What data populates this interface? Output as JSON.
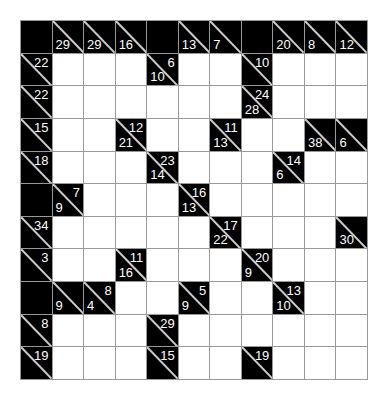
{
  "puzzle": {
    "type": "kakuro",
    "rows": 11,
    "cols": 11,
    "colors": {
      "block": "#000000",
      "cell": "#ffffff",
      "grid_line": "#999999",
      "clue_text": "#ffffff"
    },
    "grid": [
      [
        {
          "t": "b"
        },
        {
          "t": "c",
          "d": "29"
        },
        {
          "t": "c",
          "d": "29"
        },
        {
          "t": "c",
          "d": "16"
        },
        {
          "t": "b"
        },
        {
          "t": "c",
          "d": "13"
        },
        {
          "t": "c",
          "d": "7"
        },
        {
          "t": "b"
        },
        {
          "t": "c",
          "d": "20"
        },
        {
          "t": "c",
          "d": "8"
        },
        {
          "t": "c",
          "d": "12"
        }
      ],
      [
        {
          "t": "c",
          "a": "22"
        },
        {
          "t": "w"
        },
        {
          "t": "w"
        },
        {
          "t": "w"
        },
        {
          "t": "c",
          "a": "6",
          "d": "10"
        },
        {
          "t": "w"
        },
        {
          "t": "w"
        },
        {
          "t": "c",
          "a": "10"
        },
        {
          "t": "w"
        },
        {
          "t": "w"
        },
        {
          "t": "w"
        }
      ],
      [
        {
          "t": "c",
          "a": "22"
        },
        {
          "t": "w"
        },
        {
          "t": "w"
        },
        {
          "t": "w"
        },
        {
          "t": "w"
        },
        {
          "t": "w"
        },
        {
          "t": "w"
        },
        {
          "t": "c",
          "a": "24",
          "d": "28"
        },
        {
          "t": "w"
        },
        {
          "t": "w"
        },
        {
          "t": "w"
        }
      ],
      [
        {
          "t": "c",
          "a": "15"
        },
        {
          "t": "w"
        },
        {
          "t": "w"
        },
        {
          "t": "c",
          "a": "12",
          "d": "21"
        },
        {
          "t": "w"
        },
        {
          "t": "w"
        },
        {
          "t": "c",
          "a": "11",
          "d": "13"
        },
        {
          "t": "w"
        },
        {
          "t": "w"
        },
        {
          "t": "c",
          "d": "38"
        },
        {
          "t": "c",
          "d": "6"
        }
      ],
      [
        {
          "t": "c",
          "a": "18"
        },
        {
          "t": "w"
        },
        {
          "t": "w"
        },
        {
          "t": "w"
        },
        {
          "t": "c",
          "a": "23",
          "d": "14"
        },
        {
          "t": "w"
        },
        {
          "t": "w"
        },
        {
          "t": "w"
        },
        {
          "t": "c",
          "a": "14",
          "d": "6"
        },
        {
          "t": "w"
        },
        {
          "t": "w"
        }
      ],
      [
        {
          "t": "b"
        },
        {
          "t": "c",
          "a": "7",
          "d": "9"
        },
        {
          "t": "w"
        },
        {
          "t": "w"
        },
        {
          "t": "w"
        },
        {
          "t": "c",
          "a": "16",
          "d": "13"
        },
        {
          "t": "w"
        },
        {
          "t": "w"
        },
        {
          "t": "w"
        },
        {
          "t": "w"
        },
        {
          "t": "w"
        }
      ],
      [
        {
          "t": "c",
          "a": "34"
        },
        {
          "t": "w"
        },
        {
          "t": "w"
        },
        {
          "t": "w"
        },
        {
          "t": "w"
        },
        {
          "t": "w"
        },
        {
          "t": "c",
          "a": "17",
          "d": "22"
        },
        {
          "t": "w"
        },
        {
          "t": "w"
        },
        {
          "t": "w"
        },
        {
          "t": "c",
          "d": "30"
        }
      ],
      [
        {
          "t": "c",
          "a": "3"
        },
        {
          "t": "w"
        },
        {
          "t": "w"
        },
        {
          "t": "c",
          "a": "11",
          "d": "16"
        },
        {
          "t": "w"
        },
        {
          "t": "w"
        },
        {
          "t": "w"
        },
        {
          "t": "c",
          "a": "20",
          "d": "9"
        },
        {
          "t": "w"
        },
        {
          "t": "w"
        },
        {
          "t": "w"
        }
      ],
      [
        {
          "t": "b"
        },
        {
          "t": "c",
          "d": "9"
        },
        {
          "t": "c",
          "a": "8",
          "d": "4"
        },
        {
          "t": "w"
        },
        {
          "t": "w"
        },
        {
          "t": "c",
          "a": "5",
          "d": "9"
        },
        {
          "t": "w"
        },
        {
          "t": "w"
        },
        {
          "t": "c",
          "a": "13",
          "d": "10"
        },
        {
          "t": "w"
        },
        {
          "t": "w"
        }
      ],
      [
        {
          "t": "c",
          "a": "8"
        },
        {
          "t": "w"
        },
        {
          "t": "w"
        },
        {
          "t": "w"
        },
        {
          "t": "c",
          "a": "29"
        },
        {
          "t": "w"
        },
        {
          "t": "w"
        },
        {
          "t": "w"
        },
        {
          "t": "w"
        },
        {
          "t": "w"
        },
        {
          "t": "w"
        }
      ],
      [
        {
          "t": "c",
          "a": "19"
        },
        {
          "t": "w"
        },
        {
          "t": "w"
        },
        {
          "t": "w"
        },
        {
          "t": "c",
          "a": "15"
        },
        {
          "t": "w"
        },
        {
          "t": "w"
        },
        {
          "t": "c",
          "a": "19"
        },
        {
          "t": "w"
        },
        {
          "t": "w"
        },
        {
          "t": "w"
        }
      ]
    ]
  }
}
